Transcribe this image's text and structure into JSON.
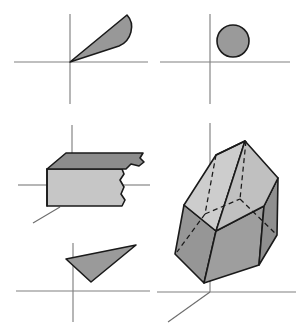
{
  "figure": {
    "background_color": "#ffffff",
    "width": 300,
    "height": 330,
    "palette": {
      "axis_gray": "#808080",
      "axis_gray_3d": "#6e6e6e",
      "edge_black": "#1a1a1a",
      "fill_dark": "#8c8c8c",
      "fill_medium": "#9c9c9c",
      "fill_light": "#c6c6c6",
      "fill_lighter": "#cdcdcd",
      "fill_mid_gray": "#969696"
    }
  },
  "panels": [
    {
      "id": "top-left",
      "name": "cone-projection-panel",
      "axes": {
        "origin": [
          70,
          62
        ],
        "x_axis": {
          "from": [
            14,
            62
          ],
          "to": [
            148,
            62
          ]
        },
        "y_axis": {
          "from": [
            70,
            14
          ],
          "to": [
            70,
            104
          ]
        }
      },
      "shape": {
        "name": "cone-wedge",
        "type": "cone",
        "fill": "#989898",
        "stroke": "#1a1a1a",
        "apex": [
          70,
          62
        ],
        "base_top": [
          127,
          15
        ],
        "base_bottom": [
          119,
          46
        ],
        "description": "Slender cone with apex at origin opening toward upper right"
      }
    },
    {
      "id": "top-right",
      "name": "circle-projection-panel",
      "axes": {
        "origin": [
          210,
          62
        ],
        "x_axis": {
          "from": [
            160,
            62
          ],
          "to": [
            290,
            62
          ]
        },
        "y_axis": {
          "from": [
            210,
            14
          ],
          "to": [
            210,
            104
          ]
        }
      },
      "shape": {
        "name": "circle-projection",
        "type": "circle",
        "fill": "#9a9a9a",
        "stroke": "#1a1a1a",
        "center": [
          233,
          41
        ],
        "radius": 16,
        "description": "Filled circle in the first quadrant"
      }
    },
    {
      "id": "middle-left",
      "name": "slab-3d-panel",
      "axes": {
        "origin": [
          72,
          185
        ],
        "z_axis": {
          "from": [
            72,
            125
          ],
          "to": [
            72,
            185
          ]
        },
        "x_axis": {
          "from": [
            18,
            185
          ],
          "to": [
            148,
            185
          ]
        },
        "y_axis": {
          "from": [
            72,
            185
          ],
          "to": [
            33,
            222
          ]
        }
      },
      "shape": {
        "name": "broken-slab",
        "type": "slab",
        "top_face_fill": "#8c8c8c",
        "front_face_fill": "#c6c6c6",
        "stroke": "#1a1a1a",
        "description": "Rectangular slab in 3D axes with torn/broken right edge"
      }
    },
    {
      "id": "bottom-left",
      "name": "triangle-projection-panel",
      "axes": {
        "origin": [
          73,
          291
        ],
        "x_axis": {
          "from": [
            16,
            291
          ],
          "to": [
            150,
            291
          ]
        },
        "y_axis": {
          "from": [
            73,
            243
          ],
          "to": [
            73,
            322
          ]
        }
      },
      "shape": {
        "name": "triangle-projection",
        "type": "triangle",
        "fill": "#9a9a9a",
        "stroke": "#1a1a1a",
        "vertices": [
          [
            66,
            259
          ],
          [
            136,
            245
          ],
          [
            91,
            282
          ]
        ],
        "description": "Small filled triangle straddling the vertical axis"
      }
    },
    {
      "id": "right",
      "name": "hexagonal-prism-panel",
      "axes": {
        "origin": [
          210,
          292
        ],
        "z_axis": {
          "from": [
            210,
            123
          ],
          "to": [
            210,
            292
          ]
        },
        "x_axis": {
          "from": [
            157,
            292
          ],
          "to": [
            296,
            292
          ]
        },
        "y_axis": {
          "from": [
            210,
            292
          ],
          "to": [
            168,
            322
          ]
        }
      },
      "shape": {
        "name": "hexagonal-prism",
        "type": "prism",
        "top_face_left_fill": "#cdcdcd",
        "top_face_right_fill": "#c0c0c0",
        "side_left_fill": "#969696",
        "side_front_fill": "#9e9e9e",
        "side_right_fill": "#8f8f8f",
        "stroke": "#1a1a1a",
        "hidden_edge_style": "dashed",
        "description": "Tilted hexagonal prism crystal with dashed hidden edges resting on the 3D origin"
      }
    }
  ]
}
